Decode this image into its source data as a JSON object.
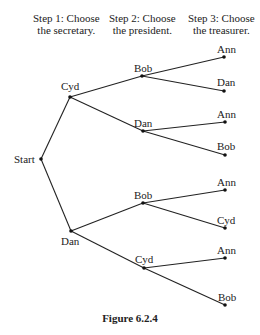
{
  "header": {
    "steps": [
      {
        "line1": "Step 1: Choose",
        "line2": "the secretary."
      },
      {
        "line1": "Step 2: Choose",
        "line2": "the president."
      },
      {
        "line1": "Step 3: Choose",
        "line2": "the treasurer."
      }
    ]
  },
  "tree": {
    "root": "Start",
    "level1": [
      "Cyd",
      "Dan"
    ],
    "level2": [
      "Bob",
      "Dan",
      "Bob",
      "Cyd"
    ],
    "leaves": [
      "Ann",
      "Dan",
      "Ann",
      "Bob",
      "Ann",
      "Cyd",
      "Ann",
      "Bob"
    ]
  },
  "caption": "Figure 6.2.4"
}
